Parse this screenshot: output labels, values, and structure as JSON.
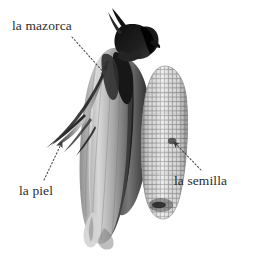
{
  "figure": {
    "kind": "annotated-photograph",
    "background_color": "#ffffff",
    "label_color": "#2b2b2b",
    "leader_color": "#4a4a4a"
  },
  "labels": [
    {
      "id": "mazorca",
      "text": "la mazorca",
      "points_to": "husked ear of corn",
      "leader": {
        "from_x": 72,
        "from_y": 37,
        "to_x": 107,
        "to_y": 76,
        "style": "dotted-arrow"
      }
    },
    {
      "id": "piel",
      "text": "la piel",
      "points_to": "husk leaf",
      "leader": {
        "from_x": 44,
        "from_y": 180,
        "to_x": 63,
        "to_y": 141,
        "style": "dotted-arrow"
      }
    },
    {
      "id": "semilla",
      "text": "la semilla",
      "points_to": "kernel on the cob",
      "leader": {
        "from_x": 201,
        "from_y": 170,
        "to_x": 173,
        "to_y": 141,
        "style": "dotted-arrow"
      }
    }
  ],
  "photo_elements": {
    "silk_tuft": "dark corn silk at top of ear",
    "husk_leaves": "long dark green-black husk leaves",
    "bare_cob": "pale cob with regular rows of kernels"
  }
}
